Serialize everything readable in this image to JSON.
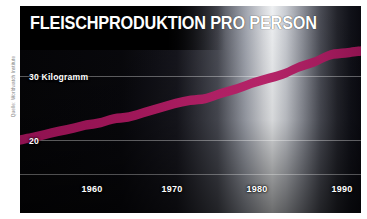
{
  "figure": {
    "title": "FLEISCHPRODUKTION PRO PERSON",
    "source_credit": "Quelle: Worldwatch Institute",
    "series_color": "#a81a5e",
    "background_colors": {
      "plate": "#000000",
      "frame": "#ffffff",
      "sheen": "#eef0f2",
      "gridline": "#ffffff"
    }
  },
  "axes": {
    "y_labels": [
      {
        "text": "30  Kilogramm",
        "value": 30
      },
      {
        "text": "20",
        "value": 20
      }
    ],
    "x_labels": [
      {
        "text": "1960",
        "value": 1960
      },
      {
        "text": "1970",
        "value": 1970
      },
      {
        "text": "1980",
        "value": 1980
      },
      {
        "text": "1990",
        "value": 1990
      }
    ]
  },
  "chart_data": {
    "type": "area",
    "title": "FLEISCHPRODUKTION PRO PERSON",
    "subtitle": "",
    "xlabel": "",
    "ylabel": "Kilogramm",
    "x_unit": "year",
    "y_unit": "Kilogramm pro Person",
    "xlim": [
      1950,
      1994
    ],
    "ylim": [
      17.5,
      37
    ],
    "grid": true,
    "gridlines_y": [
      20,
      30
    ],
    "xticks": [
      1960,
      1970,
      1980,
      1990
    ],
    "yticks": [
      20,
      30
    ],
    "ytick_labels": [
      "20",
      "30  Kilogramm"
    ],
    "legend": null,
    "legend_position": "none",
    "annotations": [],
    "series": [
      {
        "name": "Fleischproduktion pro Person",
        "color": "#a81a5e",
        "x": [
          1950,
          1952,
          1954,
          1956,
          1958,
          1960,
          1962,
          1964,
          1966,
          1968,
          1970,
          1972,
          1974,
          1976,
          1978,
          1980,
          1982,
          1984,
          1986,
          1988,
          1990,
          1992,
          1994
        ],
        "values": [
          20.0,
          20.5,
          21.1,
          21.6,
          22.2,
          22.6,
          23.3,
          23.6,
          24.3,
          25.0,
          25.7,
          26.2,
          26.5,
          27.3,
          28.0,
          28.9,
          29.6,
          30.3,
          31.4,
          32.2,
          33.3,
          33.6,
          33.9
        ]
      }
    ]
  }
}
